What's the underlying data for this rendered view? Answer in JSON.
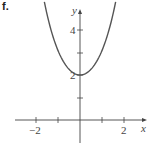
{
  "figure_label": "f.",
  "chart_data": {
    "type": "line",
    "title": "",
    "xlabel": "x",
    "ylabel": "y",
    "function": "y = e^x + e^-x",
    "xlim": [
      -2.0,
      2.8
    ],
    "ylim": [
      -1.3,
      5.3
    ],
    "x_ticks": [
      -2,
      -1,
      1,
      2
    ],
    "x_tick_labels": [
      "−2",
      "2"
    ],
    "y_ticks": [
      1,
      2,
      3,
      4
    ],
    "y_tick_labels": [
      "2",
      "4"
    ],
    "grid": false,
    "series": [
      {
        "name": "curve",
        "x": [
          -1.6,
          -1.2,
          -0.8,
          -0.4,
          0,
          0.4,
          0.8,
          1.2,
          1.6
        ],
        "y": [
          5.15,
          3.62,
          2.67,
          2.16,
          2.0,
          2.16,
          2.67,
          3.62,
          5.15
        ]
      }
    ],
    "vertex": [
      0,
      2
    ]
  },
  "axes": {
    "x_name": "x",
    "y_name": "y",
    "x_label_neg2": "−2",
    "x_label_2": "2",
    "y_label_2": "2",
    "y_label_4": "4"
  },
  "colors": {
    "curve": "#555555",
    "axes": "#444444"
  }
}
